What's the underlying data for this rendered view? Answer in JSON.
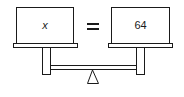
{
  "diagram": {
    "type": "balance-scale",
    "left_pan": {
      "label": "x"
    },
    "operator": "=",
    "right_pan": {
      "label": "64"
    },
    "colors": {
      "stroke": "#1a1a1a",
      "fill": "#ffffff"
    }
  }
}
